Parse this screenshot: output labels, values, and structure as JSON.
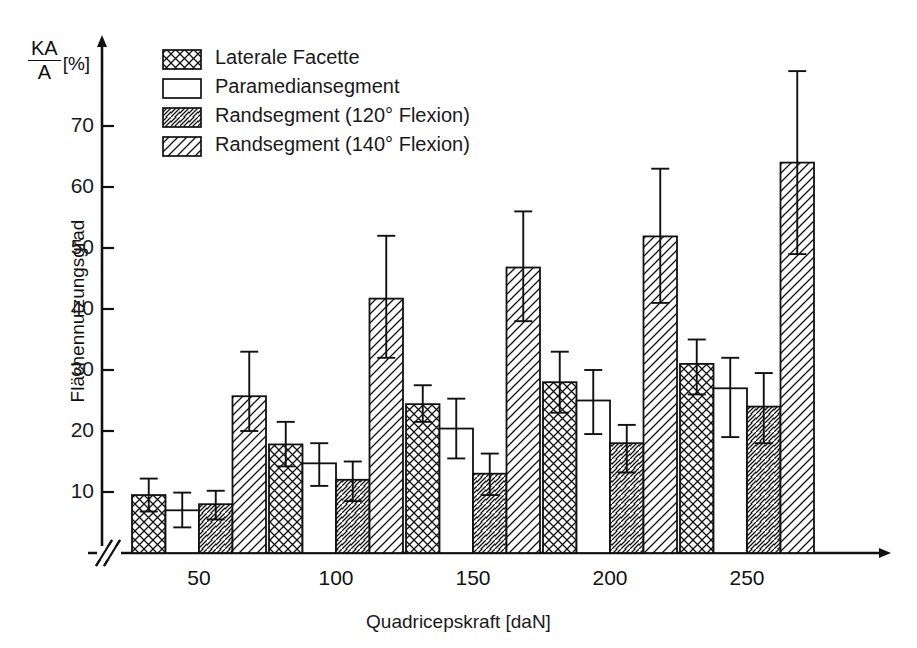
{
  "figure": {
    "y_axis_symbol_numerator": "KA",
    "y_axis_symbol_denominator": "A",
    "y_axis_symbol_unit": "[%]",
    "y_axis_title": "Flächennutzungsgrad",
    "x_axis_title": "Quadricepskraft [daN]"
  },
  "chart_data": {
    "type": "bar",
    "title": "",
    "xlabel": "Quadricepskraft [daN]",
    "ylabel": "Flächennutzungsgrad",
    "y_unit": "%",
    "y_symbol": "KA/A [%]",
    "ylim": [
      0,
      80
    ],
    "yticks": [
      10,
      20,
      30,
      40,
      50,
      60,
      70
    ],
    "grid": false,
    "axis_break_on_x": true,
    "legend_position": "top-left-inside",
    "categories": [
      "50",
      "100",
      "150",
      "200",
      "250"
    ],
    "error_bar_type": "standard deviation",
    "series": [
      {
        "name": "Laterale Facette",
        "pattern": "cross-hatch",
        "values": [
          9.5,
          17.8,
          24.4,
          28.0,
          31.0
        ],
        "err_upper": [
          12.2,
          21.5,
          27.5,
          33.0,
          35.0
        ],
        "err_lower": [
          6.8,
          14.2,
          21.5,
          23.0,
          26.0
        ]
      },
      {
        "name": "Paramediansegment",
        "pattern": "none",
        "values": [
          7.0,
          14.7,
          20.4,
          25.0,
          27.0
        ],
        "err_upper": [
          9.9,
          18.0,
          25.3,
          30.0,
          32.0
        ],
        "err_lower": [
          4.2,
          11.0,
          15.5,
          19.5,
          19.0
        ]
      },
      {
        "name": "Randsegment (120° Flexion)",
        "pattern": "hatch-back",
        "values": [
          8.0,
          12.0,
          13.0,
          18.0,
          24.0
        ],
        "err_upper": [
          10.2,
          15.0,
          16.3,
          21.0,
          29.5
        ],
        "err_lower": [
          5.5,
          8.5,
          9.5,
          13.2,
          18.0
        ]
      },
      {
        "name": "Randsegment (140° Flexion)",
        "pattern": "hatch-fwd",
        "values": [
          25.7,
          41.7,
          46.8,
          51.9,
          64.0
        ],
        "err_upper": [
          33.0,
          52.0,
          56.0,
          63.0,
          79.0
        ],
        "err_lower": [
          20.0,
          32.0,
          38.0,
          41.0,
          49.0
        ]
      }
    ]
  },
  "legend": {
    "items": [
      {
        "label": "Laterale Facette",
        "pattern": "cross-hatch"
      },
      {
        "label": "Paramediansegment",
        "pattern": "none"
      },
      {
        "label": "Randsegment (120° Flexion)",
        "pattern": "hatch-back"
      },
      {
        "label": "Randsegment (140° Flexion)",
        "pattern": "hatch-fwd"
      }
    ]
  },
  "colors": {
    "ink": "#111111",
    "background": "#ffffff"
  }
}
